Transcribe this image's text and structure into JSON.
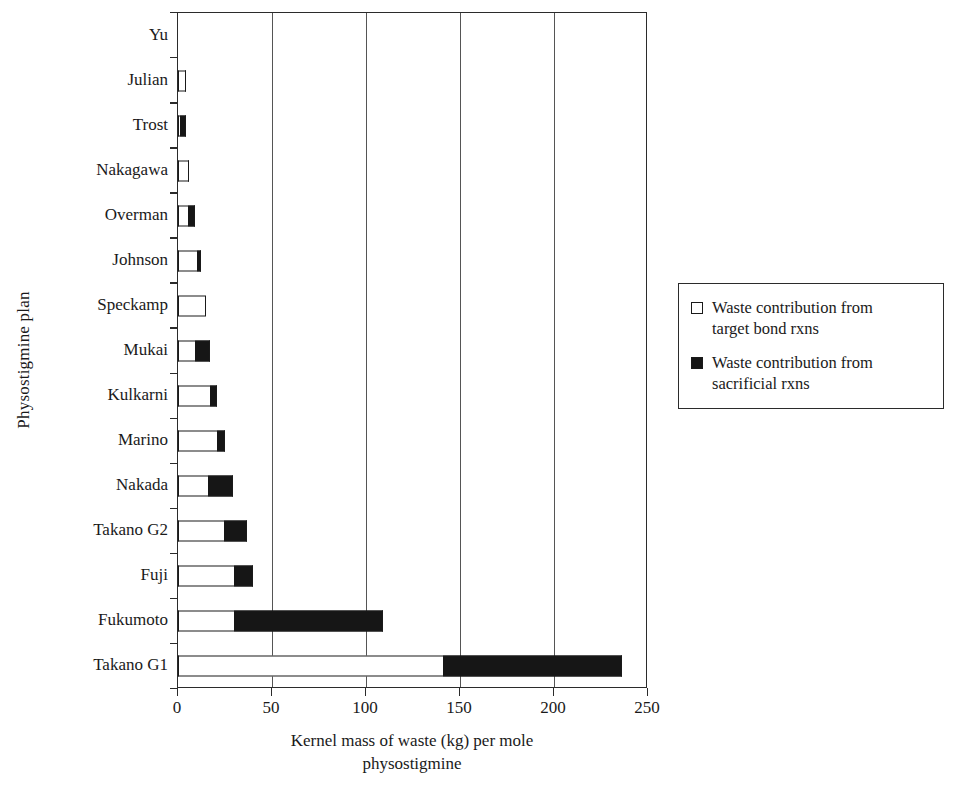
{
  "chart_data": {
    "type": "bar",
    "orientation": "horizontal",
    "stacked": true,
    "title": "",
    "xlabel": "Kernel mass of waste (kg) per mole physostigmine",
    "xlabel_lines": [
      "Kernel mass of waste (kg) per mole",
      "physostigmine"
    ],
    "ylabel": "Physostigmine plan",
    "xlim": [
      0,
      250
    ],
    "ylim_categories_count": 15,
    "xticks": [
      0,
      50,
      100,
      150,
      200,
      250
    ],
    "xtick_labels": [
      "0",
      "50",
      "100",
      "150",
      "200",
      "250"
    ],
    "grid": "vertical",
    "legend_position": "right",
    "categories": [
      "Yu",
      "Julian",
      "Trost",
      "Nakagawa",
      "Overman",
      "Johnson",
      "Speckamp",
      "Mukai",
      "Kulkarni",
      "Marino",
      "Nakada",
      "Takano G2",
      "Fuji",
      "Fukumoto",
      "Takano G1"
    ],
    "series": [
      {
        "name": "Waste contribution from target bond rxns",
        "color": "#ffffff",
        "values": [
          0,
          3.5,
          1.0,
          5.5,
          5.5,
          10.0,
          15.0,
          9.0,
          17.0,
          21.0,
          16.0,
          24.5,
          30.0,
          30.0,
          141.0
        ]
      },
      {
        "name": "Waste contribution from sacrificial rxns",
        "color": "#161616",
        "values": [
          0,
          0.8,
          3.0,
          0.5,
          3.5,
          2.0,
          0.0,
          8.0,
          4.0,
          4.0,
          13.0,
          12.0,
          10.0,
          79.0,
          95.0
        ]
      }
    ],
    "totals": [
      0,
      4.3,
      4.0,
      6.0,
      9.0,
      12.0,
      15.0,
      17.0,
      21.0,
      25.0,
      29.0,
      36.5,
      40.0,
      109.0,
      236.0
    ]
  },
  "legend": {
    "items": [
      {
        "swatch": "hollow",
        "label_line1": "Waste contribution from",
        "label_line2": "target bond rxns"
      },
      {
        "swatch": "filled",
        "label_line1": "Waste contribution from",
        "label_line2": "sacrificial rxns"
      }
    ]
  }
}
